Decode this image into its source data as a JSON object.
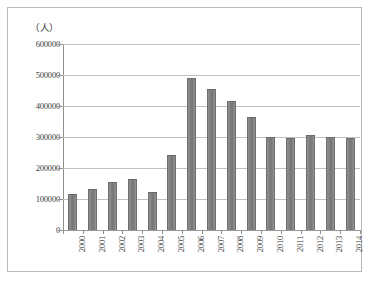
{
  "chart_data": {
    "type": "bar",
    "title": "",
    "subtitle": "",
    "xlabel": "",
    "ylabel": "（人）",
    "unit_label": "（人）",
    "categories": [
      "2000",
      "2001",
      "2002",
      "2003",
      "2004",
      "2005",
      "2006",
      "2007",
      "2008",
      "2009",
      "2010",
      "2011",
      "2012",
      "2013",
      "2014"
    ],
    "values": [
      115000,
      133000,
      155000,
      163000,
      124000,
      241000,
      489000,
      455000,
      417000,
      365000,
      300000,
      297000,
      306000,
      300000,
      298000
    ],
    "series": [
      {
        "name": "人数",
        "values": [
          115000,
          133000,
          155000,
          163000,
          124000,
          241000,
          489000,
          455000,
          417000,
          365000,
          300000,
          297000,
          306000,
          300000,
          298000
        ]
      }
    ],
    "ylim": [
      0,
      600000
    ],
    "ytick_values": [
      0,
      100000,
      200000,
      300000,
      400000,
      500000,
      600000
    ],
    "ytick_labels": [
      "0",
      "100000",
      "200000",
      "300000",
      "400000",
      "500000",
      "600000"
    ],
    "grid": true,
    "grid_axis": "y",
    "legend": false,
    "legend_position": "none",
    "bar_color": "#7d7d7d",
    "grid_color": "#c0c0c0",
    "axis_color": "#8f8f8f",
    "frame_color": "#b9b9b9",
    "text_color": "#3d3d3d",
    "background": "#ffffff",
    "xlabel_rotation": -90
  }
}
